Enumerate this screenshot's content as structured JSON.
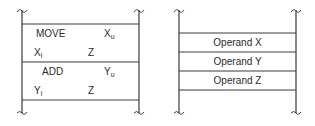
{
  "left_diagram": {
    "description": "Memory with two-instruction program",
    "rows": [
      {
        "opcode": "MOVE",
        "operand": {
          "base": "X",
          "sub": "u"
        }
      },
      {
        "operand1": {
          "base": "X",
          "sub": "l"
        },
        "operand2": "Z"
      },
      {
        "opcode": "ADD",
        "operand": {
          "base": "Y",
          "sub": "u"
        }
      },
      {
        "operand1": {
          "base": "Y",
          "sub": "l"
        },
        "operand2": "Z"
      }
    ]
  },
  "right_diagram": {
    "description": "Memory with operands",
    "cells": [
      "Operand X",
      "Operand Y",
      "Operand Z"
    ]
  },
  "colors": {
    "line": "#3a3a3a",
    "text": "#2a2a2a",
    "background": "#ffffff"
  }
}
